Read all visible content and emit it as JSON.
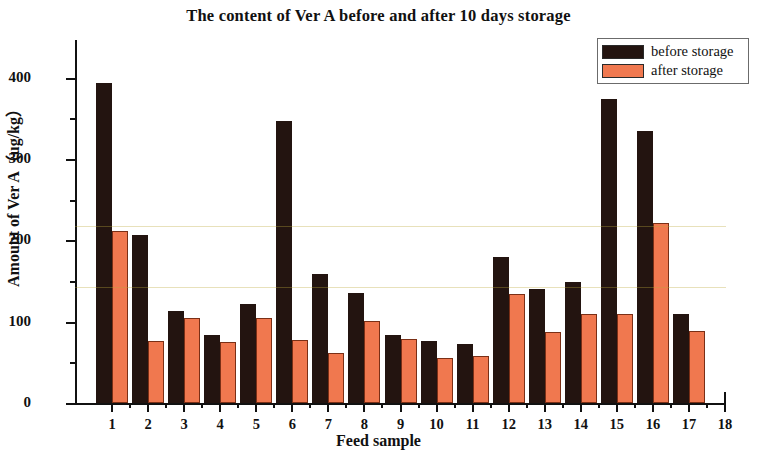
{
  "chart_data": {
    "type": "bar",
    "title": "The content of Ver A before and after 10 days storage",
    "xlabel": "Feed sample",
    "ylabel": "Amount of Ver A（ug/kg）",
    "categories": [
      "1",
      "2",
      "3",
      "4",
      "5",
      "6",
      "7",
      "8",
      "9",
      "10",
      "11",
      "12",
      "13",
      "14",
      "15",
      "16",
      "17"
    ],
    "xlim": [
      0,
      18
    ],
    "xticks": [
      1,
      2,
      3,
      4,
      5,
      6,
      7,
      8,
      9,
      10,
      11,
      12,
      13,
      14,
      15,
      16,
      17,
      18
    ],
    "ylim": [
      0,
      440
    ],
    "yticks": [
      0,
      100,
      200,
      300,
      400
    ],
    "yminorticks": [
      50,
      150,
      250,
      350
    ],
    "grid": false,
    "legend_position": "top-right",
    "series": [
      {
        "name": "before storage",
        "color": "#231410",
        "values": [
          393,
          206,
          113,
          83,
          122,
          347,
          159,
          135,
          83,
          76,
          72,
          179,
          140,
          149,
          374,
          334,
          109
        ]
      },
      {
        "name": "after storage",
        "color": "#f0784f",
        "values": [
          211,
          76,
          105,
          75,
          105,
          77,
          61,
          101,
          79,
          55,
          58,
          134,
          87,
          110,
          109,
          221,
          89
        ]
      }
    ]
  },
  "legend": {
    "items": [
      {
        "label": "before storage",
        "color": "#231410"
      },
      {
        "label": "after storage",
        "color": "#f0784f"
      }
    ]
  }
}
